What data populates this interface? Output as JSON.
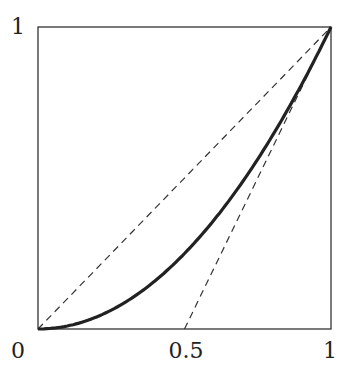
{
  "chart_data": {
    "type": "line",
    "title": "",
    "xlabel": "",
    "ylabel": "",
    "xlim": [
      0,
      1
    ],
    "ylim": [
      0,
      1
    ],
    "grid": false,
    "legend": null,
    "x_tick_labels": [
      "0",
      "0.5",
      "1"
    ],
    "y_tick_labels": [
      "1"
    ],
    "series": [
      {
        "name": "curve",
        "style": "solid-thick",
        "color": "#222222",
        "x": [
          0,
          0.1,
          0.2,
          0.3,
          0.4,
          0.5,
          0.6,
          0.7,
          0.8,
          0.9,
          1.0
        ],
        "y": [
          0,
          0.01,
          0.04,
          0.09,
          0.16,
          0.25,
          0.36,
          0.49,
          0.64,
          0.81,
          1.0
        ]
      },
      {
        "name": "diagonal",
        "style": "dashed",
        "color": "#333333",
        "x": [
          0,
          1
        ],
        "y": [
          0,
          1
        ]
      },
      {
        "name": "tangent-at-1",
        "style": "dashed",
        "color": "#333333",
        "x": [
          0.5,
          1
        ],
        "y": [
          0,
          1
        ]
      }
    ]
  },
  "labels": {
    "x0": "0",
    "x05": "0.5",
    "x1": "1",
    "y1": "1"
  }
}
